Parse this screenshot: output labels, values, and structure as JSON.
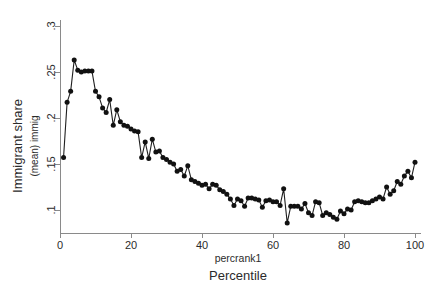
{
  "chart_data": {
    "type": "line",
    "title": "",
    "xlabel": "Percentile",
    "xlabel_secondary": "percrank1",
    "ylabel": "Immigrant share",
    "ylabel_secondary": "(mean) immig",
    "xlim": [
      0,
      101
    ],
    "ylim": [
      0.08,
      0.305
    ],
    "xticks": [
      0,
      20,
      40,
      60,
      80,
      100
    ],
    "xticklabels": [
      "0",
      "20",
      "40",
      "60",
      "80",
      "100"
    ],
    "yticks": [
      0.1,
      0.15,
      0.2,
      0.25,
      0.3
    ],
    "yticklabels": [
      ".1",
      ".15",
      ".2",
      ".25",
      ".3"
    ],
    "grid": false,
    "legend": "none",
    "marker": "filled-circle",
    "line_color": "#202020",
    "marker_color": "#111111",
    "axis_color": "#8a8a8a",
    "series": [
      {
        "name": "(mean) immig",
        "x": [
          1,
          2,
          3,
          4,
          5,
          6,
          7,
          8,
          9,
          10,
          11,
          12,
          13,
          14,
          15,
          16,
          17,
          18,
          19,
          20,
          21,
          22,
          23,
          24,
          25,
          26,
          27,
          28,
          29,
          30,
          31,
          32,
          33,
          34,
          35,
          36,
          37,
          38,
          39,
          40,
          41,
          42,
          43,
          44,
          45,
          46,
          47,
          48,
          49,
          50,
          51,
          52,
          53,
          54,
          55,
          56,
          57,
          58,
          59,
          60,
          61,
          62,
          63,
          64,
          65,
          66,
          67,
          68,
          69,
          70,
          71,
          72,
          73,
          74,
          75,
          76,
          77,
          78,
          79,
          80,
          81,
          82,
          83,
          84,
          85,
          86,
          87,
          88,
          89,
          90,
          91,
          92,
          93,
          94,
          95,
          96,
          97,
          98,
          99,
          100
        ],
        "values": [
          0.157,
          0.217,
          0.229,
          0.263,
          0.252,
          0.25,
          0.251,
          0.251,
          0.251,
          0.229,
          0.223,
          0.211,
          0.206,
          0.22,
          0.192,
          0.209,
          0.196,
          0.192,
          0.191,
          0.188,
          0.186,
          0.185,
          0.157,
          0.174,
          0.156,
          0.177,
          0.163,
          0.164,
          0.157,
          0.155,
          0.152,
          0.15,
          0.142,
          0.144,
          0.137,
          0.148,
          0.133,
          0.131,
          0.129,
          0.127,
          0.128,
          0.123,
          0.128,
          0.127,
          0.122,
          0.12,
          0.117,
          0.112,
          0.105,
          0.112,
          0.11,
          0.104,
          0.113,
          0.113,
          0.112,
          0.111,
          0.103,
          0.11,
          0.111,
          0.109,
          0.109,
          0.105,
          0.123,
          0.086,
          0.104,
          0.104,
          0.104,
          0.101,
          0.107,
          0.097,
          0.094,
          0.109,
          0.108,
          0.094,
          0.097,
          0.095,
          0.092,
          0.09,
          0.099,
          0.096,
          0.101,
          0.1,
          0.109,
          0.11,
          0.109,
          0.108,
          0.108,
          0.11,
          0.112,
          0.114,
          0.112,
          0.125,
          0.117,
          0.121,
          0.131,
          0.128,
          0.137,
          0.142,
          0.135,
          0.152
        ]
      }
    ]
  }
}
